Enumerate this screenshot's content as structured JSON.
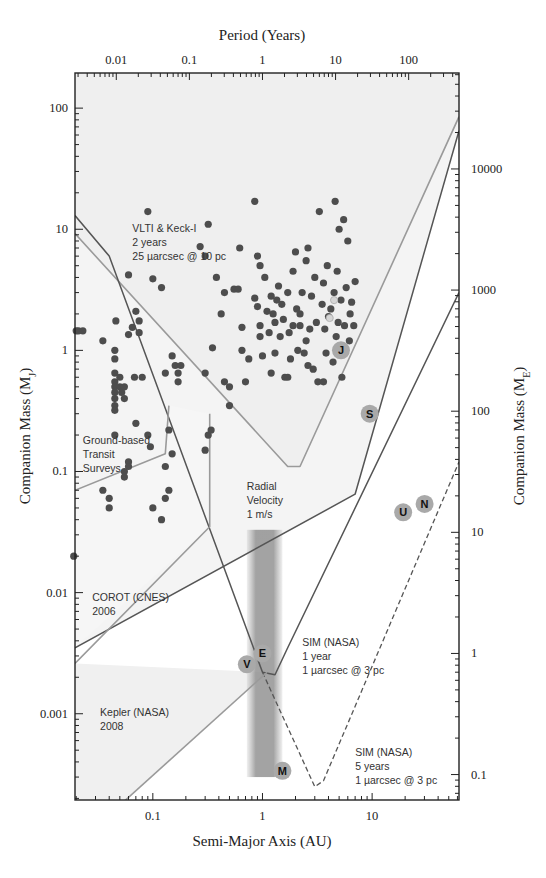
{
  "chart_data": {
    "type": "scatter",
    "title": "",
    "xlabel": "Semi-Major Axis (AU)",
    "ylabel": "Companion Mass (M_J)",
    "top_xlabel": "Period (Years)",
    "right_ylabel": "Companion Mass (M_E)",
    "xscale": "log",
    "yscale": "log",
    "xlim": [
      0.0195,
      62
    ],
    "ylim": [
      0.000194,
      195
    ],
    "grid": false,
    "x_ticks": [
      {
        "value": 0.1,
        "label": "0.1"
      },
      {
        "value": 1,
        "label": "1"
      },
      {
        "value": 10,
        "label": "10"
      }
    ],
    "y_ticks": [
      {
        "value": 100,
        "label": "100"
      },
      {
        "value": 10,
        "label": "10"
      },
      {
        "value": 1,
        "label": "1"
      },
      {
        "value": 0.1,
        "label": "0.1"
      },
      {
        "value": 0.01,
        "label": "0.01"
      },
      {
        "value": 0.001,
        "label": "0.001"
      }
    ],
    "top_ticks": [
      {
        "value": 0.01,
        "label": "0.01"
      },
      {
        "value": 0.1,
        "label": "0.1"
      },
      {
        "value": 1,
        "label": "1"
      },
      {
        "value": 10,
        "label": "10"
      },
      {
        "value": 100,
        "label": "100"
      }
    ],
    "right_ticks": [
      {
        "value": 10000,
        "label": "10000"
      },
      {
        "value": 1000,
        "label": "1000"
      },
      {
        "value": 100,
        "label": "100"
      },
      {
        "value": 10,
        "label": "10"
      },
      {
        "value": 1,
        "label": "1"
      },
      {
        "value": 0.1,
        "label": "0.1"
      }
    ],
    "earth_masses_per_jupiter": 317.8,
    "known_planets": [
      [
        0.02,
        1.45
      ],
      [
        0.021,
        1.45
      ],
      [
        0.023,
        1.45
      ],
      [
        0.019,
        0.02
      ],
      [
        0.035,
        1.2
      ],
      [
        0.045,
        1.0
      ],
      [
        0.045,
        0.85
      ],
      [
        0.045,
        0.65
      ],
      [
        0.045,
        0.55
      ],
      [
        0.045,
        0.5
      ],
      [
        0.045,
        0.45
      ],
      [
        0.045,
        0.4
      ],
      [
        0.045,
        0.35
      ],
      [
        0.045,
        0.32
      ],
      [
        0.045,
        0.2
      ],
      [
        0.046,
        1.75
      ],
      [
        0.05,
        0.6
      ],
      [
        0.05,
        0.5
      ],
      [
        0.052,
        0.45
      ],
      [
        0.055,
        0.5
      ],
      [
        0.055,
        0.4
      ],
      [
        0.06,
        0.12
      ],
      [
        0.06,
        0.11
      ],
      [
        0.055,
        0.1
      ],
      [
        0.06,
        1.35
      ],
      [
        0.065,
        1.55
      ],
      [
        0.068,
        0.6
      ],
      [
        0.07,
        2.1
      ],
      [
        0.075,
        1.4
      ],
      [
        0.075,
        1.75
      ],
      [
        0.08,
        0.6
      ],
      [
        0.09,
        14
      ],
      [
        0.06,
        4.2
      ],
      [
        0.1,
        3.9
      ],
      [
        0.12,
        3.3
      ],
      [
        0.15,
        0.9
      ],
      [
        0.16,
        0.75
      ],
      [
        0.17,
        0.55
      ],
      [
        0.17,
        0.65
      ],
      [
        0.18,
        0.75
      ],
      [
        0.13,
        0.65
      ],
      [
        0.14,
        0.22
      ],
      [
        0.15,
        0.14
      ],
      [
        0.13,
        0.11
      ],
      [
        0.07,
        0.25
      ],
      [
        0.09,
        0.2
      ],
      [
        0.095,
        0.16
      ],
      [
        0.12,
        0.04
      ],
      [
        0.1,
        0.05
      ],
      [
        0.13,
        0.06
      ],
      [
        0.14,
        0.07
      ],
      [
        0.055,
        0.09
      ],
      [
        0.04,
        0.06
      ],
      [
        0.04,
        0.05
      ],
      [
        0.035,
        0.07
      ],
      [
        0.27,
        7.2
      ],
      [
        0.3,
        6.0
      ],
      [
        0.32,
        11
      ],
      [
        0.35,
        1.05
      ],
      [
        0.3,
        0.65
      ],
      [
        0.32,
        0.2
      ],
      [
        0.3,
        0.15
      ],
      [
        0.34,
        0.22
      ],
      [
        0.38,
        4.0
      ],
      [
        0.42,
        2.0
      ],
      [
        0.45,
        3.0
      ],
      [
        0.45,
        0.55
      ],
      [
        0.5,
        0.5
      ],
      [
        0.5,
        0.35
      ],
      [
        0.55,
        3.2
      ],
      [
        0.6,
        3.2
      ],
      [
        0.62,
        7.0
      ],
      [
        0.65,
        1.55
      ],
      [
        0.65,
        1.0
      ],
      [
        0.7,
        0.55
      ],
      [
        0.75,
        0.85
      ],
      [
        0.85,
        17
      ],
      [
        0.9,
        6.0
      ],
      [
        0.95,
        5.0
      ],
      [
        0.9,
        2.3
      ],
      [
        0.95,
        1.6
      ],
      [
        0.95,
        1.3
      ],
      [
        1.0,
        0.9
      ],
      [
        1.05,
        4.0
      ],
      [
        1.1,
        2.1
      ],
      [
        1.15,
        1.4
      ],
      [
        1.2,
        2.8
      ],
      [
        1.25,
        2.0
      ],
      [
        1.3,
        0.95
      ],
      [
        1.3,
        1.7
      ],
      [
        1.35,
        2.6
      ],
      [
        1.4,
        3.4
      ],
      [
        1.45,
        1.3
      ],
      [
        1.5,
        2.4
      ],
      [
        1.55,
        1.8
      ],
      [
        1.6,
        0.6
      ],
      [
        1.7,
        3.0
      ],
      [
        1.75,
        1.4
      ],
      [
        1.8,
        0.85
      ],
      [
        1.9,
        4.5
      ],
      [
        2.0,
        6.5
      ],
      [
        2.05,
        2.2
      ],
      [
        2.1,
        1.0
      ],
      [
        2.2,
        1.6
      ],
      [
        2.3,
        3.0
      ],
      [
        2.4,
        0.95
      ],
      [
        2.5,
        5.5
      ],
      [
        2.5,
        1.2
      ],
      [
        2.6,
        7.0
      ],
      [
        2.7,
        1.5
      ],
      [
        2.8,
        2.8
      ],
      [
        2.9,
        0.7
      ],
      [
        3.0,
        4.0
      ],
      [
        3.1,
        1.7
      ],
      [
        3.2,
        0.55
      ],
      [
        3.3,
        14
      ],
      [
        3.5,
        2.4
      ],
      [
        3.6,
        3.6
      ],
      [
        3.7,
        1.5
      ],
      [
        3.8,
        0.95
      ],
      [
        3.9,
        5.0
      ],
      [
        4.0,
        1.9
      ],
      [
        4.2,
        2.2
      ],
      [
        4.4,
        0.8
      ],
      [
        4.5,
        3.0
      ],
      [
        4.6,
        17
      ],
      [
        4.7,
        1.3
      ],
      [
        4.8,
        4.5
      ],
      [
        5.0,
        10
      ],
      [
        5.2,
        2.6
      ],
      [
        5.3,
        0.6
      ],
      [
        5.5,
        12
      ],
      [
        5.6,
        1.6
      ],
      [
        5.8,
        3.3
      ],
      [
        6.0,
        8
      ],
      [
        6.2,
        1.2
      ],
      [
        6.5,
        2.5
      ],
      [
        7.0,
        3.7
      ],
      [
        6.8,
        1.6
      ],
      [
        6.3,
        2.0
      ],
      [
        1.9,
        1.6
      ],
      [
        2.2,
        2.0
      ],
      [
        0.85,
        2.7
      ],
      [
        1.2,
        0.65
      ],
      [
        1.7,
        0.6
      ],
      [
        2.6,
        0.75
      ],
      [
        3.6,
        0.55
      ],
      [
        4.9,
        1.7
      ]
    ],
    "highlighted_planets": [
      [
        4.5,
        2.6
      ],
      [
        4.1,
        1.85
      ]
    ],
    "solar_system": [
      {
        "label": "J",
        "a": 5.2,
        "m": 1.0
      },
      {
        "label": "S",
        "a": 9.5,
        "m": 0.3
      },
      {
        "label": "U",
        "a": 19.2,
        "m": 0.046
      },
      {
        "label": "N",
        "a": 30.1,
        "m": 0.054
      },
      {
        "label": "E",
        "a": 1.0,
        "m": 0.00315
      },
      {
        "label": "V",
        "a": 0.72,
        "m": 0.00256
      },
      {
        "label": "M",
        "a": 1.52,
        "m": 0.000338
      }
    ],
    "habitable_zone": {
      "a_min": 0.72,
      "a_max": 1.52,
      "m_min": 0.0003,
      "m_max": 0.033
    },
    "curves": [
      {
        "name": "VLTI & Keck-I (2 years, 25 µarcsec @ 10 pc)",
        "style": "solid-light",
        "points": [
          [
            0.0195,
            9.2
          ],
          [
            1.7,
            0.11
          ],
          [
            2.2,
            0.11
          ],
          [
            62,
            85
          ]
        ]
      },
      {
        "name": "Radial Velocity (1 m/s)",
        "style": "solid-dark",
        "points": [
          [
            0.0195,
            0.0035
          ],
          [
            7,
            0.065
          ],
          [
            62,
            65
          ]
        ]
      },
      {
        "name": "SIM (NASA) 1 year (1 µarcsec @ 3 pc)",
        "style": "solid-dark",
        "points": [
          [
            0.0195,
            13
          ],
          [
            0.04,
            6
          ],
          [
            1.0,
            0.0022
          ],
          [
            1.3,
            0.0021
          ],
          [
            1.7,
            0.0035
          ],
          [
            62,
            3.0
          ]
        ]
      },
      {
        "name": "SIM (NASA) 5 years (1 µarcsec @ 3 pc)",
        "style": "dashed",
        "points": [
          [
            1.0,
            0.0022
          ],
          [
            3.0,
            0.00025
          ],
          [
            3.6,
            0.00028
          ],
          [
            62,
            0.12
          ]
        ]
      },
      {
        "name": "Ground-based Transit Surveys",
        "style": "solid-light",
        "points": [
          [
            0.0195,
            0.07
          ],
          [
            0.13,
            0.14
          ],
          [
            0.14,
            0.35
          ]
        ]
      },
      {
        "name": "COROT (CNES) 2006",
        "style": "solid-light",
        "points": [
          [
            0.0195,
            0.0026
          ],
          [
            0.33,
            0.035
          ],
          [
            0.33,
            0.3
          ]
        ]
      },
      {
        "name": "Kepler (NASA) 2008",
        "style": "solid-light",
        "points": [
          [
            0.055,
            0.00019
          ],
          [
            1.1,
            0.0022
          ]
        ]
      }
    ],
    "annotations": [
      {
        "lines": [
          "VLTI & Keck-I",
          "2 years",
          "25 µarcsec @ 10 pc"
        ],
        "a": 0.065,
        "m": 9.5
      },
      {
        "lines": [
          "Ground-based",
          "Transit",
          "Surveys"
        ],
        "a": 0.023,
        "m": 0.17
      },
      {
        "lines": [
          "Radial",
          "Velocity",
          "1 m/s"
        ],
        "a": 0.72,
        "m": 0.07
      },
      {
        "lines": [
          "COROT (CNES)",
          "2006"
        ],
        "a": 0.028,
        "m": 0.0085
      },
      {
        "lines": [
          "SIM (NASA)",
          "1 year",
          "1 µarcsec @ 3 pc"
        ],
        "a": 2.3,
        "m": 0.0036
      },
      {
        "lines": [
          "SIM (NASA)",
          "5 years",
          "1 µarcsec @ 3 pc"
        ],
        "a": 7.0,
        "m": 0.00045
      },
      {
        "lines": [
          "Kepler (NASA)",
          "2008"
        ],
        "a": 0.033,
        "m": 0.00095
      }
    ]
  }
}
